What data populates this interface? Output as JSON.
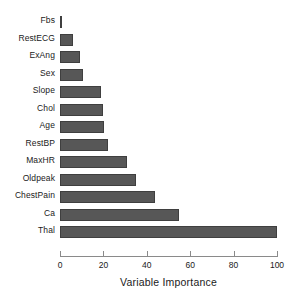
{
  "chart_data": {
    "type": "bar",
    "orientation": "horizontal",
    "title": "",
    "xlabel": "Variable Importance",
    "ylabel": "",
    "xlim": [
      0,
      100
    ],
    "xticks": [
      0,
      20,
      40,
      60,
      80,
      100
    ],
    "grid": false,
    "legend": null,
    "bar_color": "#575757",
    "bar_edge_color": "#3f3f3f",
    "categories": [
      "Fbs",
      "RestECG",
      "ExAng",
      "Sex",
      "Slope",
      "Chol",
      "Age",
      "RestBP",
      "MaxHR",
      "Oldpeak",
      "ChestPain",
      "Ca",
      "Thal"
    ],
    "values": [
      1,
      6,
      9,
      10.5,
      19,
      20,
      20.5,
      22,
      31,
      35,
      44,
      55,
      100
    ]
  }
}
